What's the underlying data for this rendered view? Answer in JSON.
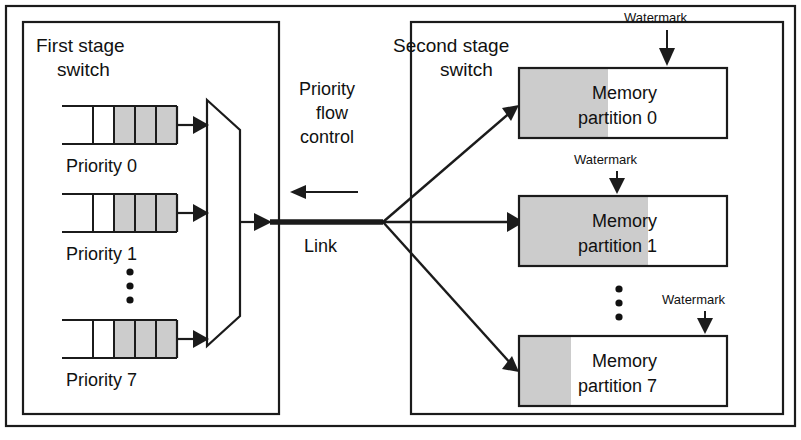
{
  "figure": {
    "type": "block-diagram",
    "colors": {
      "line": "#1b1b1b",
      "text": "#111111",
      "shade_fill": "#cccccc",
      "background": "#ffffff"
    }
  },
  "first_stage": {
    "label_line1": "First stage",
    "label_line2": "switch",
    "queues": [
      {
        "label": "Priority 0",
        "cells_total": 4,
        "cells_filled": 3
      },
      {
        "label": "Priority 1",
        "cells_total": 4,
        "cells_filled": 3
      },
      {
        "label": "Priority 7",
        "cells_total": 4,
        "cells_filled": 3
      }
    ],
    "vertical_ellipsis": "⋮",
    "mux_name": "priority-multiplexer"
  },
  "middle": {
    "flow_control_line1": "Priority",
    "flow_control_line2": "flow",
    "flow_control_line3": "control",
    "flow_control_direction": "right-to-left",
    "link_label": "Link"
  },
  "second_stage": {
    "label_line1": "Second stage",
    "label_line2": "switch",
    "vertical_ellipsis": "⋮",
    "partitions": [
      {
        "name_line1": "Memory",
        "name_line2": "partition 0",
        "watermark_label": "Watermark",
        "fill_fraction": 0.43,
        "watermark_fraction": 0.71
      },
      {
        "name_line1": "Memory",
        "name_line2": "partition 1",
        "watermark_label": "Watermark",
        "fill_fraction": 0.62,
        "watermark_fraction": 0.47
      },
      {
        "name_line1": "Memory",
        "name_line2": "partition 7",
        "watermark_label": "Watermark",
        "fill_fraction": 0.25,
        "watermark_fraction": 0.89
      }
    ]
  }
}
